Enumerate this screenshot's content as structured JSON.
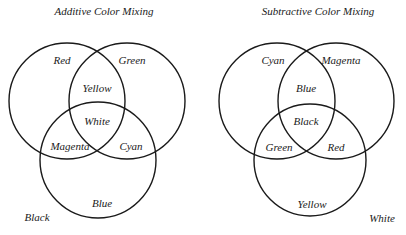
{
  "additive": {
    "title": "Additive Color Mixing",
    "stroke_color": "#1a1a1a",
    "circles": [
      {
        "name": "Red",
        "cx": 67,
        "cy": 101,
        "r": 58
      },
      {
        "name": "Green",
        "cx": 127,
        "cy": 101,
        "r": 58
      },
      {
        "name": "Blue",
        "cx": 98,
        "cy": 160,
        "r": 58
      }
    ],
    "labels": {
      "red": "Red",
      "green": "Green",
      "blue": "Blue",
      "yellow": "Yellow",
      "magenta": "Magenta",
      "cyan": "Cyan",
      "white": "White",
      "background": "Black"
    }
  },
  "subtractive": {
    "title": "Subtractive Color Mixing",
    "stroke_color": "#1a1a1a",
    "circles": [
      {
        "name": "Cyan",
        "cx": 277,
        "cy": 101,
        "r": 58
      },
      {
        "name": "Magenta",
        "cx": 336,
        "cy": 101,
        "r": 58
      },
      {
        "name": "Yellow",
        "cx": 310,
        "cy": 160,
        "r": 56
      }
    ],
    "labels": {
      "cyan": "Cyan",
      "magenta": "Magenta",
      "yellow": "Yellow",
      "blue": "Blue",
      "green": "Green",
      "red": "Red",
      "black": "Black",
      "background": "White"
    }
  }
}
